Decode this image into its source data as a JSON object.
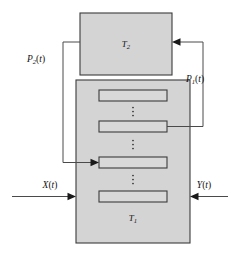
{
  "diagram": {
    "blocks": [
      {
        "id": "T2",
        "name": "upper-block",
        "label_base": "T",
        "label_sub": "2",
        "x": 80,
        "y": 13,
        "width": 92,
        "height": 62,
        "fill": "#d4d4d4",
        "stroke": "#3b3b3b"
      },
      {
        "id": "T1",
        "name": "lower-block",
        "label_base": "T",
        "label_sub": "1",
        "x": 76,
        "y": 80,
        "width": 114,
        "height": 163,
        "fill": "#d4d4d4",
        "stroke": "#3b3b3b"
      }
    ],
    "inner_rects": [
      {
        "id": "rect-1",
        "x": 99,
        "y": 90,
        "width": 68,
        "height": 11
      },
      {
        "id": "rect-2",
        "x": 99,
        "y": 121,
        "width": 68,
        "height": 11
      },
      {
        "id": "rect-3",
        "x": 99,
        "y": 157,
        "width": 68,
        "height": 11
      },
      {
        "id": "rect-4",
        "x": 99,
        "y": 191,
        "width": 68,
        "height": 11
      }
    ],
    "ellipses": [
      {
        "id": "ellipsis-1",
        "x": 133,
        "y": 111,
        "glyph": "vertical-dots"
      },
      {
        "id": "ellipsis-2",
        "x": 133,
        "y": 144,
        "glyph": "vertical-dots"
      },
      {
        "id": "ellipsis-3",
        "x": 133,
        "y": 179,
        "glyph": "vertical-dots"
      }
    ],
    "signals": [
      {
        "id": "X",
        "name": "input-signal-x",
        "label_base": "X",
        "label_open": "(",
        "label_var": "t",
        "label_close": ")",
        "label_x": 50,
        "label_y": 188,
        "direction": "right"
      },
      {
        "id": "Y",
        "name": "input-signal-y",
        "label_base": "Y",
        "label_open": "(",
        "label_var": "t",
        "label_close": ")",
        "label_x": 204,
        "label_y": 188,
        "direction": "left"
      },
      {
        "id": "P1",
        "name": "feedback-signal-p1",
        "label_base": "P",
        "label_sub": "1",
        "label_open": "(",
        "label_var": "t",
        "label_close": ")",
        "label_x": 195,
        "label_y": 82,
        "direction": "up-left"
      },
      {
        "id": "P2",
        "name": "feedback-signal-p2",
        "label_base": "P",
        "label_sub": "2",
        "label_open": "(",
        "label_var": "t",
        "label_close": ")",
        "label_x": 36,
        "label_y": 62,
        "direction": "down-right"
      }
    ],
    "colors": {
      "block_fill": "#d4d4d4",
      "inner_fill": "#d9d9d9",
      "outline": "#3b3b3b",
      "connector": "#4a4a4a",
      "arrow": "#1a1a1a",
      "text": "#111111",
      "background": "#ffffff"
    }
  }
}
